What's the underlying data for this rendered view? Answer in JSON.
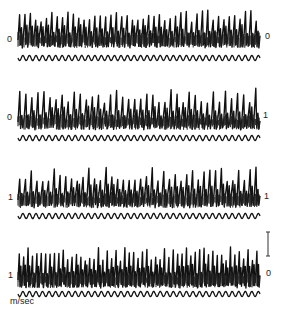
{
  "chart_data": {
    "type": "line",
    "title": "",
    "xlabel": "",
    "ylabel": "",
    "unit_label": "m/sec",
    "grid": false,
    "legend": null,
    "panels": [
      {
        "id": 1,
        "left_label": "0",
        "right_label": "0",
        "series": [
          {
            "name": "oscillating trace",
            "description": "dense high-frequency spiky waveform, ~45 major peaks"
          },
          {
            "name": "reference sinusoid",
            "cycles": 37
          }
        ]
      },
      {
        "id": 2,
        "left_label": "0",
        "right_label": "1",
        "series": [
          {
            "name": "oscillating trace",
            "description": "regular tall spikes, ~40 major peaks, baseline noisy band"
          },
          {
            "name": "reference sinusoid",
            "cycles": 37
          }
        ]
      },
      {
        "id": 3,
        "left_label": "1",
        "right_label": "1",
        "series": [
          {
            "name": "oscillating trace",
            "description": "irregular spikes with varying amplitude, ~42 major peaks"
          },
          {
            "name": "reference sinusoid",
            "cycles": 37
          }
        ]
      },
      {
        "id": 4,
        "left_label": "1",
        "right_label": "0",
        "series": [
          {
            "name": "oscillating trace",
            "description": "very dense high-frequency spikes, ~55 major peaks"
          },
          {
            "name": "reference sinusoid",
            "cycles": 37
          }
        ],
        "scale_bar": true
      }
    ]
  }
}
